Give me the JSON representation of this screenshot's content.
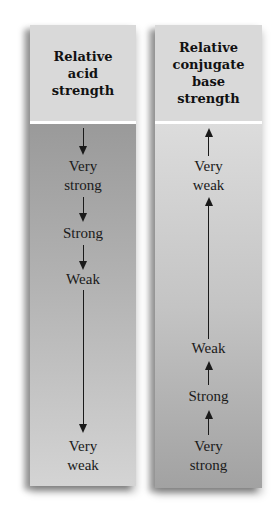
{
  "diagram": {
    "left_column": {
      "title": "Relative\nacid\nstrength",
      "direction": "down",
      "labels": [
        "Very\nstrong",
        "Strong",
        "Weak",
        "Very\nweak"
      ],
      "gradient": {
        "top": "#9a9a9a",
        "bottom": "#d4d4d4"
      }
    },
    "right_column": {
      "title": "Relative\nconjugate\nbase\nstrength",
      "direction": "up",
      "labels": [
        "Very\nweak",
        "Weak",
        "Strong",
        "Very\nstrong"
      ],
      "gradient": {
        "top": "#dcdcdc",
        "bottom": "#a2a2a2"
      }
    },
    "colors": {
      "header_bg": "#d9d9d9",
      "text": "#1a1a1a",
      "separator": "#ffffff"
    }
  }
}
